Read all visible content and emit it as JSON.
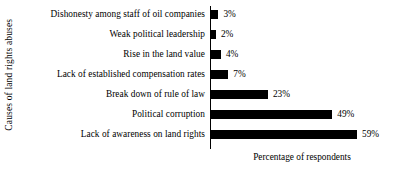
{
  "chart_data": {
    "type": "bar",
    "orientation": "horizontal",
    "title": "",
    "xlabel": "Percentage of respondents",
    "ylabel": "Causes of land rights abuses",
    "categories": [
      "Dishonesty among staff of oil companies",
      "Weak political leadership",
      "Rise in the land value",
      "Lack of established compensation rates",
      "Break down of rule of law",
      "Political corruption",
      "Lack of awareness on land rights"
    ],
    "values": [
      3,
      2,
      4,
      7,
      23,
      49,
      59
    ],
    "value_labels": [
      "3%",
      "2%",
      "4%",
      "7%",
      "23%",
      "49%",
      "59%"
    ],
    "unit": "%",
    "xlim": [
      0,
      74
    ],
    "grid": false,
    "legend": null,
    "bar_color": "#000000",
    "background_color": "#ffffff",
    "axis_color": "#000000"
  },
  "axes": {
    "y_title": "Causes of land rights abuses",
    "x_title": "Percentage of respondents"
  }
}
